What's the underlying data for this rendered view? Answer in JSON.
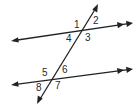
{
  "diagram": {
    "lines": {
      "top_parallel": {
        "x1": 11,
        "y1": 41,
        "x2": 132,
        "y2": 23
      },
      "bottom_parallel": {
        "x1": 11,
        "y1": 85,
        "x2": 132,
        "y2": 69
      },
      "transversal": {
        "x1": 98,
        "y1": 4,
        "x2": 37,
        "y2": 104
      }
    },
    "angle_labels": [
      {
        "id": "1",
        "text": "1",
        "x": 74,
        "y": 28
      },
      {
        "id": "2",
        "text": "2",
        "x": 93,
        "y": 24
      },
      {
        "id": "3",
        "text": "3",
        "x": 85,
        "y": 41
      },
      {
        "id": "4",
        "text": "4",
        "x": 66,
        "y": 42
      },
      {
        "id": "5",
        "text": "5",
        "x": 42,
        "y": 76
      },
      {
        "id": "6",
        "text": "6",
        "x": 62,
        "y": 73
      },
      {
        "id": "7",
        "text": "7",
        "x": 55,
        "y": 89
      },
      {
        "id": "8",
        "text": "8",
        "x": 36,
        "y": 91
      }
    ],
    "colors": {
      "stroke": "#222222",
      "background": "#ffffff"
    }
  }
}
